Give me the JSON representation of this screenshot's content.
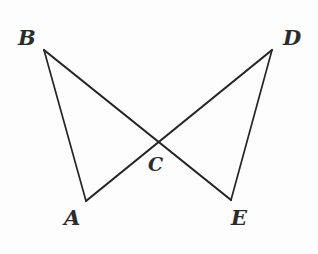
{
  "figure": {
    "kind": "geometry-diagram",
    "canvas": {
      "width": 318,
      "height": 254
    },
    "background_color": "#fdfdfd",
    "stroke_color": "#262626",
    "label_color": "#2b2b2b"
  },
  "points": [
    {
      "id": "B",
      "label": "B",
      "x": 44,
      "y": 50,
      "label_x": 18,
      "label_y": 27,
      "font_size": 21
    },
    {
      "id": "D",
      "label": "D",
      "x": 272,
      "y": 50,
      "label_x": 283,
      "label_y": 27,
      "font_size": 21
    },
    {
      "id": "A",
      "label": "A",
      "x": 86,
      "y": 201,
      "label_x": 64,
      "label_y": 207,
      "font_size": 21
    },
    {
      "id": "E",
      "label": "E",
      "x": 231,
      "y": 200,
      "label_x": 231,
      "label_y": 207,
      "font_size": 21
    },
    {
      "id": "C",
      "label": "C",
      "x": 158,
      "y": 142,
      "label_x": 148,
      "label_y": 155,
      "font_size": 19
    }
  ],
  "segments": [
    {
      "id": "BA",
      "from": "B",
      "to": "A",
      "x1": 44,
      "y1": 50,
      "x2": 86,
      "y2": 201,
      "width": 1.7
    },
    {
      "id": "BE",
      "from": "B",
      "to": "E",
      "x1": 44,
      "y1": 50,
      "x2": 231,
      "y2": 200,
      "width": 2.2
    },
    {
      "id": "DE",
      "from": "D",
      "to": "E",
      "x1": 272,
      "y1": 50,
      "x2": 231,
      "y2": 200,
      "width": 1.7
    },
    {
      "id": "DA",
      "from": "D",
      "to": "A",
      "x1": 272,
      "y1": 50,
      "x2": 86,
      "y2": 201,
      "width": 2.2
    }
  ]
}
